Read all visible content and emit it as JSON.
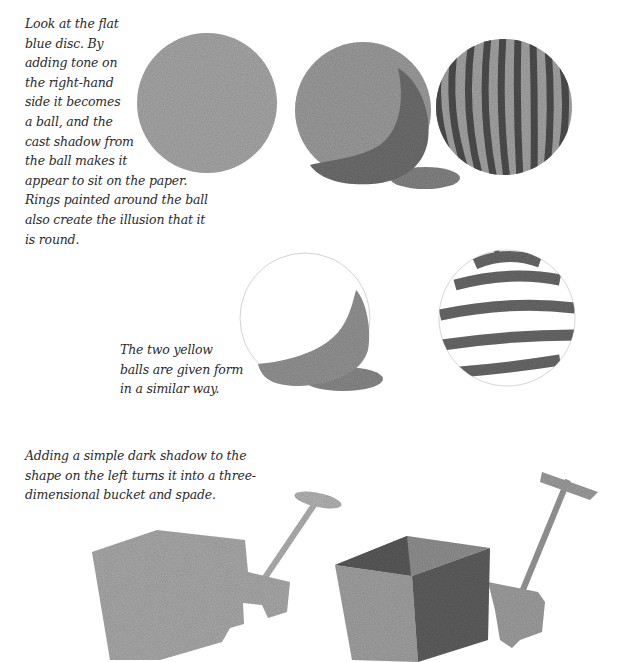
{
  "captions": {
    "discs": {
      "lines": [
        "Look at the flat",
        "blue disc. By",
        "adding tone on",
        "the right-hand",
        "side it becomes",
        "a ball, and the",
        "cast shadow from",
        "the ball makes it",
        "appear to sit on the paper.",
        "Rings painted around the ball",
        "also create the illusion that it",
        "is round."
      ]
    },
    "yellow_balls": {
      "lines": [
        "The two yellow",
        "balls are given form",
        "in a similar way."
      ]
    },
    "bucket": {
      "lines": [
        "Adding a simple dark shadow to the",
        "shape on the left turns it into a three-",
        "dimensional bucket and spade."
      ]
    }
  },
  "illustrations": [
    {
      "name": "flat-blue-disc",
      "label": "Flat disc"
    },
    {
      "name": "shaded-ball-with-cast-shadow",
      "label": "Ball with tone and cast shadow"
    },
    {
      "name": "striped-ball",
      "label": "Ball with vertical stripes"
    },
    {
      "name": "yellow-ball-shaded",
      "label": "Yellow ball with shading"
    },
    {
      "name": "yellow-ball-rings",
      "label": "Yellow ball with rings"
    },
    {
      "name": "flat-bucket-and-spade",
      "label": "Flat bucket and spade shape"
    },
    {
      "name": "3d-bucket-and-spade",
      "label": "Three-dimensional bucket and spade"
    }
  ],
  "colors": {
    "paint_light": "#a8a8a8",
    "paint_mid": "#8c8c8c",
    "paint_dark": "#5a5a5a",
    "outline": "#cfcfcf",
    "text": "#2b2b2b"
  }
}
